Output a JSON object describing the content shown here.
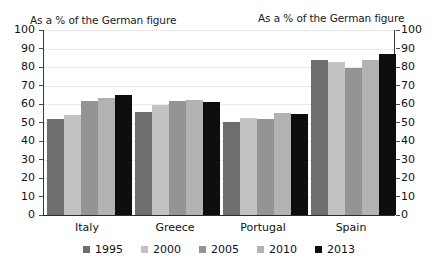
{
  "chart_data": {
    "type": "bar",
    "title": "",
    "left_axis_caption": "As a % of the German figure",
    "right_axis_caption": "As a % of the German figure",
    "xlabel": "",
    "ylabel": "",
    "ylim": [
      0,
      100
    ],
    "y_ticks": [
      0,
      10,
      20,
      30,
      40,
      50,
      60,
      70,
      80,
      90,
      100
    ],
    "grid": true,
    "grid_style": "dotted",
    "legend_position": "bottom",
    "dual_axis": true,
    "categories": [
      "Italy",
      "Greece",
      "Portugal",
      "Spain"
    ],
    "series": [
      {
        "name": "1995",
        "color": "#6e6e6e",
        "values": [
          52,
          55.5,
          50.5,
          84
        ]
      },
      {
        "name": "2000",
        "color": "#c2c2c2",
        "values": [
          54,
          59.5,
          52.5,
          82.5
        ]
      },
      {
        "name": "2005",
        "color": "#949494",
        "values": [
          61.5,
          61.5,
          52,
          79.5
        ]
      },
      {
        "name": "2010",
        "color": "#b2b2b2",
        "values": [
          63.5,
          62,
          55,
          84
        ]
      },
      {
        "name": "2013",
        "color": "#0d0d0d",
        "values": [
          65,
          61,
          54.5,
          87
        ]
      }
    ]
  },
  "colors": {
    "background": "#ffffff",
    "axis": "#3a3a3a",
    "grid": "#d9d9d9",
    "text": "#111111"
  }
}
